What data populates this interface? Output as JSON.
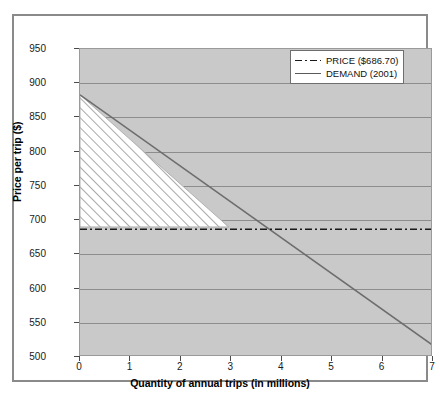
{
  "chart_data": {
    "type": "line",
    "title": "",
    "xlabel": "Quantity of annual trips (in millions)",
    "ylabel": "Price per trip ($)",
    "xlim": [
      0,
      7
    ],
    "ylim": [
      500,
      950
    ],
    "xticks": [
      "0",
      "1",
      "2",
      "3",
      "4",
      "5",
      "6",
      "7"
    ],
    "yticks": [
      "500",
      "550",
      "600",
      "650",
      "700",
      "750",
      "800",
      "850",
      "900",
      "950"
    ],
    "grid": "horizontal",
    "legend_position": "top-right",
    "series": [
      {
        "name": "PRICE ($686.70)",
        "style": "dash-dot",
        "color": "#1a1a1a",
        "type": "horizontal-line",
        "value": 686.7,
        "x": [
          0,
          7
        ],
        "values": [
          686.7,
          686.7
        ]
      },
      {
        "name": "DEMAND (2001)",
        "style": "solid",
        "color": "#6d6d6d",
        "type": "line",
        "x": [
          0,
          7
        ],
        "values": [
          883,
          517
        ]
      }
    ],
    "shaded_region": {
      "name": "consumer-surplus-triangle",
      "fill": "diagonal-hatch",
      "vertices_x": [
        0,
        0,
        2.95
      ],
      "vertices_y": [
        883,
        690,
        690
      ]
    },
    "plot_background": "#c9c9c9",
    "figure_background": "#ffffff"
  },
  "legend": {
    "items": [
      {
        "label": "PRICE ($686.70)",
        "style": "dash-dot"
      },
      {
        "label": "DEMAND (2001)",
        "style": "solid"
      }
    ]
  },
  "axes": {
    "y_title": "Price per trip ($)",
    "x_title": "Quantity of annual trips (in millions)",
    "y_labels": [
      "950",
      "900",
      "850",
      "800",
      "750",
      "700",
      "650",
      "600",
      "550",
      "500"
    ],
    "x_labels": [
      "0",
      "1",
      "2",
      "3",
      "4",
      "5",
      "6",
      "7"
    ]
  }
}
